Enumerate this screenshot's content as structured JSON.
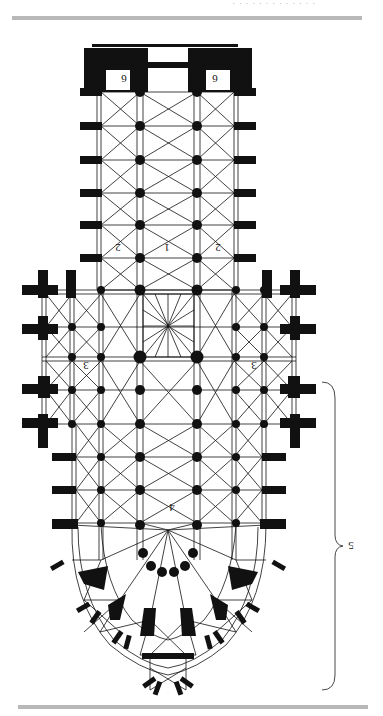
{
  "page": {
    "orientation": "rotated-180",
    "header_text": "· · · · · · · · · · · · ·",
    "rule_color": "#b8b8b8",
    "ink_color": "#111111"
  },
  "figure": {
    "type": "cathedral-floor-plan",
    "labels": {
      "nave": "1",
      "aisle_left": "2",
      "aisle_right": "2",
      "transept_left": "3",
      "transept_right": "3",
      "choir": "4",
      "chevet_brace": "5",
      "tower_left": "6",
      "tower_right": "6"
    }
  }
}
